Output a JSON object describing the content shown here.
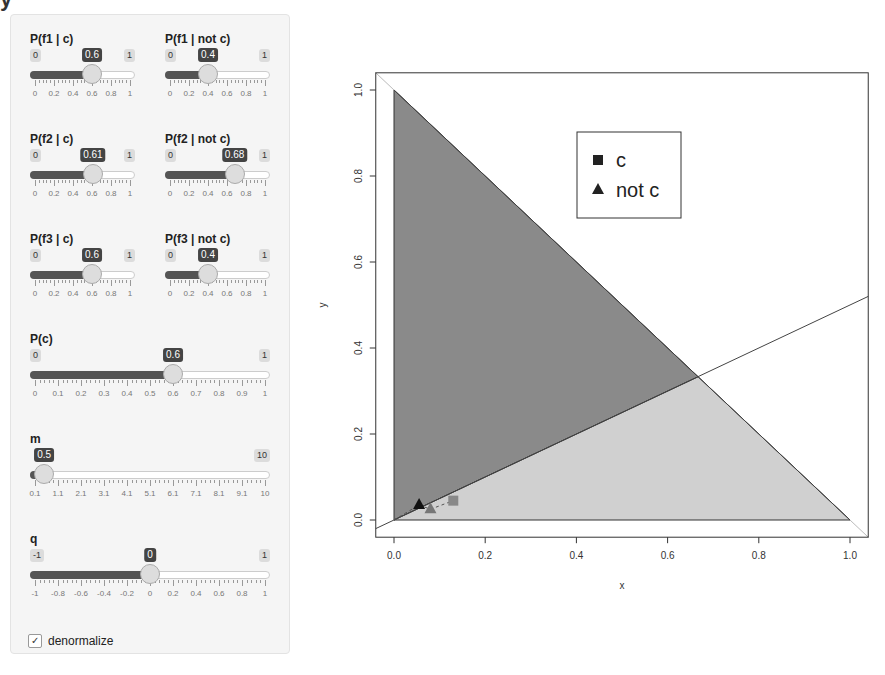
{
  "page": {
    "title_fragment": "y"
  },
  "sidebar": {
    "sliders": [
      {
        "id": "pf1c",
        "label": "P(f1 | c)",
        "min": "0",
        "max": "1",
        "value": "0.6",
        "frac": 0.6,
        "ticks": [
          "0",
          "0.2",
          "0.4",
          "0.6",
          "0.8",
          "1"
        ]
      },
      {
        "id": "pf1nc",
        "label": "P(f1 | not c)",
        "min": "0",
        "max": "1",
        "value": "0.4",
        "frac": 0.4,
        "ticks": [
          "0",
          "0.2",
          "0.4",
          "0.6",
          "0.8",
          "1"
        ]
      },
      {
        "id": "pf2c",
        "label": "P(f2 | c)",
        "min": "0",
        "max": "1",
        "value": "0.61",
        "frac": 0.61,
        "ticks": [
          "0",
          "0.2",
          "0.4",
          "0.6",
          "0.8",
          "1"
        ]
      },
      {
        "id": "pf2nc",
        "label": "P(f2 | not c)",
        "min": "0",
        "max": "1",
        "value": "0.68",
        "frac": 0.68,
        "ticks": [
          "0",
          "0.2",
          "0.4",
          "0.6",
          "0.8",
          "1"
        ]
      },
      {
        "id": "pf3c",
        "label": "P(f3 | c)",
        "min": "0",
        "max": "1",
        "value": "0.6",
        "frac": 0.6,
        "ticks": [
          "0",
          "0.2",
          "0.4",
          "0.6",
          "0.8",
          "1"
        ]
      },
      {
        "id": "pf3nc",
        "label": "P(f3 | not c)",
        "min": "0",
        "max": "1",
        "value": "0.4",
        "frac": 0.4,
        "ticks": [
          "0",
          "0.2",
          "0.4",
          "0.6",
          "0.8",
          "1"
        ]
      },
      {
        "id": "pc",
        "label": "P(c)",
        "min": "0",
        "max": "1",
        "value": "0.6",
        "frac": 0.6,
        "ticks": [
          "0",
          "0.1",
          "0.2",
          "0.3",
          "0.4",
          "0.5",
          "0.6",
          "0.7",
          "0.8",
          "0.9",
          "1"
        ]
      },
      {
        "id": "m",
        "label": "m",
        "min": "",
        "max": "10",
        "value": "0.5",
        "frac": 0.04,
        "ticks": [
          "0.1",
          "1.1",
          "2.1",
          "3.1",
          "4.1",
          "5.1",
          "6.1",
          "7.1",
          "8.1",
          "9.1",
          "10"
        ]
      },
      {
        "id": "q",
        "label": "q",
        "min": "-1",
        "max": "1",
        "value": "0",
        "frac": 0.5,
        "ticks": [
          "-1",
          "-0.8",
          "-0.6",
          "-0.4",
          "-0.2",
          "0",
          "0.2",
          "0.4",
          "0.6",
          "0.8",
          "1"
        ]
      }
    ],
    "denormalize": {
      "label": "denormalize",
      "checked": true,
      "glyph": "✓"
    }
  },
  "chart_data": {
    "type": "scatter",
    "title": "",
    "xlabel": "x",
    "ylabel": "y",
    "xlim": [
      -0.04,
      1.04
    ],
    "ylim": [
      -0.04,
      1.04
    ],
    "xticks": [
      "0.0",
      "0.2",
      "0.4",
      "0.6",
      "0.8",
      "1.0"
    ],
    "yticks": [
      "0.0",
      "0.2",
      "0.4",
      "0.6",
      "0.8",
      "1.0"
    ],
    "grid": false,
    "regions": [
      {
        "name": "c region",
        "fill": "#8a8a8a",
        "polygon": [
          [
            0,
            1
          ],
          [
            0,
            0
          ],
          [
            0.667,
            0.333
          ]
        ]
      },
      {
        "name": "not c region",
        "fill": "#d0d0d0",
        "polygon": [
          [
            0,
            0
          ],
          [
            1,
            0
          ],
          [
            0.667,
            0.333
          ]
        ]
      }
    ],
    "lines": [
      {
        "name": "simplex edge x+y=1",
        "points": [
          [
            0,
            1
          ],
          [
            1,
            0
          ]
        ]
      },
      {
        "name": "decision boundary y=0.5x",
        "points": [
          [
            -0.04,
            -0.02
          ],
          [
            1.04,
            0.52
          ]
        ]
      }
    ],
    "points": [
      {
        "series": "not c",
        "marker": "triangle",
        "color": "#111111",
        "x": 0.055,
        "y": 0.035
      },
      {
        "series": "not c",
        "marker": "triangle",
        "color": "#777777",
        "x": 0.08,
        "y": 0.025
      },
      {
        "series": "c",
        "marker": "square",
        "color": "#888888",
        "x": 0.13,
        "y": 0.045
      }
    ],
    "legend": {
      "position": "top-right-inner",
      "entries": [
        {
          "label": "c",
          "marker": "square"
        },
        {
          "label": "not c",
          "marker": "triangle"
        }
      ]
    }
  }
}
